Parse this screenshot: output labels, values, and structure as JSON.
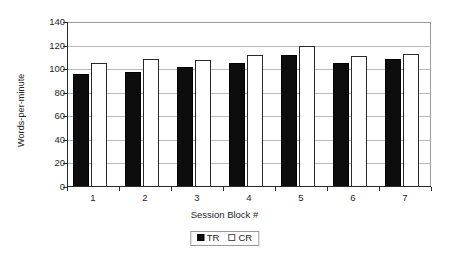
{
  "chart_data": {
    "type": "bar",
    "title": "",
    "xlabel": "Session Block #",
    "ylabel": "Words-per-minute",
    "categories": [
      "1",
      "2",
      "3",
      "4",
      "5",
      "6",
      "7"
    ],
    "series": [
      {
        "name": "TR",
        "color": "#0d0d0d",
        "values": [
          96,
          98,
          102,
          105,
          112,
          105,
          109
        ]
      },
      {
        "name": "CR",
        "color": "#ffffff",
        "values": [
          105,
          109,
          108,
          112,
          120,
          111,
          113
        ]
      }
    ],
    "ylim": [
      0,
      140
    ],
    "ytick_values": [
      0,
      20,
      40,
      60,
      80,
      100,
      120,
      140
    ],
    "ytick_labels": [
      "0",
      "20",
      "40",
      "60",
      "80",
      "100",
      "120",
      "140"
    ],
    "grid": "horizontal",
    "legend_position": "bottom-center",
    "legend_entries": [
      "TR",
      "CR"
    ]
  }
}
